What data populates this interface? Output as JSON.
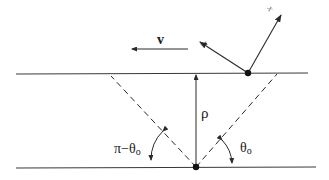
{
  "diagram": {
    "labels": {
      "velocity": "v",
      "distance": "ρ",
      "angle_left": "π−θ",
      "angle_left_sub": "o",
      "angle_right": "θ",
      "angle_right_sub": "o",
      "axis_x": "x",
      "axis_y": "y"
    },
    "colors": {
      "line": "#2a2a2a",
      "background": "#ffffff"
    }
  }
}
